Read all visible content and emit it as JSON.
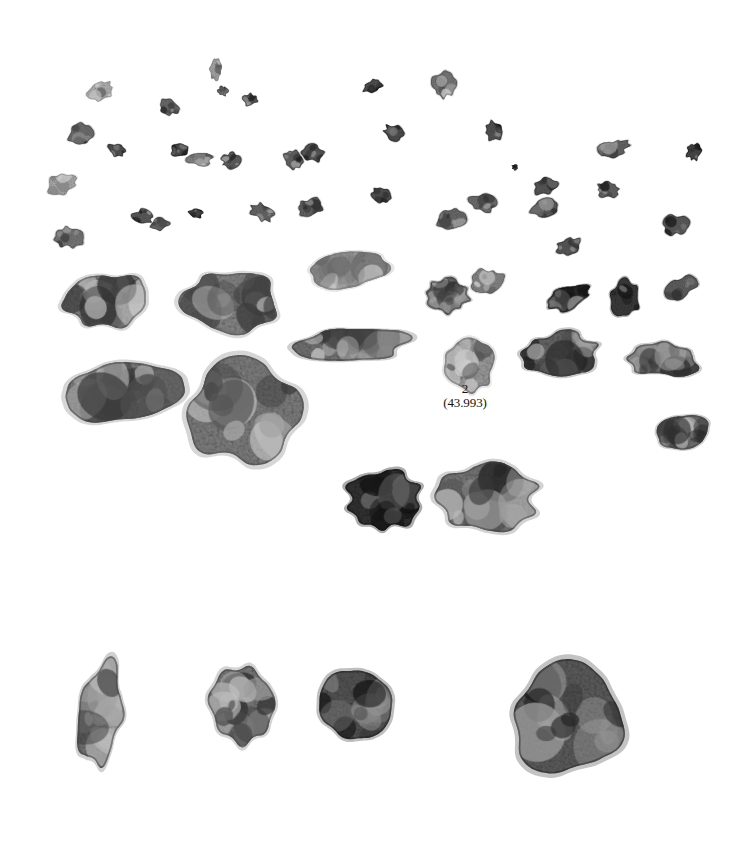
{
  "plate": {
    "width": 735,
    "height": 843,
    "background_color": "#ffffff",
    "description": "Black-and-white archival specimen photograph of rock fragments on a plain white background",
    "ink_color": "#15130f"
  },
  "labels": [
    {
      "name": "sample-label-2",
      "number": "2",
      "mass": "(43.993)",
      "x": 465,
      "y": 391
    }
  ],
  "groups": [
    {
      "name": "fines-and-fragments-cluster",
      "description": "Upper dense field of small to medium angular fragments"
    },
    {
      "name": "large-chips-row",
      "description": "Lower row of four larger chips"
    }
  ],
  "fragments": [
    {
      "id": "f001",
      "cx": 101,
      "cy": 91,
      "rx": 13,
      "ry": 9,
      "rot": -18,
      "tone": 0.86,
      "seed": 11,
      "rough": 0.4
    },
    {
      "id": "f002",
      "cx": 216,
      "cy": 70,
      "rx": 6,
      "ry": 10,
      "rot": 8,
      "tone": 0.8,
      "seed": 12,
      "rough": 0.42
    },
    {
      "id": "f003",
      "cx": 223,
      "cy": 91,
      "rx": 5,
      "ry": 5,
      "rot": 0,
      "tone": 0.52,
      "seed": 13,
      "rough": 0.45
    },
    {
      "id": "f004",
      "cx": 169,
      "cy": 107,
      "rx": 10,
      "ry": 7,
      "rot": 22,
      "tone": 0.48,
      "seed": 14,
      "rough": 0.42
    },
    {
      "id": "f005",
      "cx": 250,
      "cy": 100,
      "rx": 7,
      "ry": 6,
      "rot": -10,
      "tone": 0.4,
      "seed": 15,
      "rough": 0.44
    },
    {
      "id": "f006",
      "cx": 313,
      "cy": 153,
      "rx": 11,
      "ry": 8,
      "rot": 14,
      "tone": 0.38,
      "seed": 16,
      "rough": 0.42
    },
    {
      "id": "f007",
      "cx": 373,
      "cy": 86,
      "rx": 10,
      "ry": 6,
      "rot": -24,
      "tone": 0.34,
      "seed": 17,
      "rough": 0.4
    },
    {
      "id": "f008",
      "cx": 444,
      "cy": 84,
      "rx": 11,
      "ry": 13,
      "rot": 10,
      "tone": 0.55,
      "seed": 18,
      "rough": 0.44
    },
    {
      "id": "f009",
      "cx": 81,
      "cy": 135,
      "rx": 12,
      "ry": 10,
      "rot": -30,
      "tone": 0.5,
      "seed": 19,
      "rough": 0.44
    },
    {
      "id": "f010",
      "cx": 117,
      "cy": 150,
      "rx": 9,
      "ry": 6,
      "rot": 12,
      "tone": 0.34,
      "seed": 20,
      "rough": 0.4
    },
    {
      "id": "f011",
      "cx": 180,
      "cy": 150,
      "rx": 9,
      "ry": 6,
      "rot": -6,
      "tone": 0.3,
      "seed": 21,
      "rough": 0.42
    },
    {
      "id": "f012",
      "cx": 199,
      "cy": 159,
      "rx": 13,
      "ry": 7,
      "rot": 8,
      "tone": 0.62,
      "seed": 22,
      "rough": 0.46
    },
    {
      "id": "f013",
      "cx": 231,
      "cy": 161,
      "rx": 9,
      "ry": 8,
      "rot": 0,
      "tone": 0.42,
      "seed": 23,
      "rough": 0.44
    },
    {
      "id": "f014",
      "cx": 293,
      "cy": 160,
      "rx": 9,
      "ry": 10,
      "rot": -12,
      "tone": 0.44,
      "seed": 24,
      "rough": 0.45
    },
    {
      "id": "f015",
      "cx": 394,
      "cy": 133,
      "rx": 10,
      "ry": 8,
      "rot": 20,
      "tone": 0.32,
      "seed": 25,
      "rough": 0.43
    },
    {
      "id": "f016",
      "cx": 494,
      "cy": 131,
      "rx": 9,
      "ry": 10,
      "rot": -14,
      "tone": 0.36,
      "seed": 26,
      "rough": 0.44
    },
    {
      "id": "f017",
      "cx": 515,
      "cy": 167,
      "rx": 3,
      "ry": 3,
      "rot": 0,
      "tone": 0.22,
      "seed": 27,
      "rough": 0.5
    },
    {
      "id": "f018",
      "cx": 545,
      "cy": 186,
      "rx": 12,
      "ry": 8,
      "rot": -16,
      "tone": 0.38,
      "seed": 28,
      "rough": 0.44
    },
    {
      "id": "f019",
      "cx": 612,
      "cy": 149,
      "rx": 16,
      "ry": 8,
      "rot": -20,
      "tone": 0.46,
      "seed": 29,
      "rough": 0.46
    },
    {
      "id": "f020",
      "cx": 694,
      "cy": 152,
      "rx": 7,
      "ry": 8,
      "rot": 10,
      "tone": 0.3,
      "seed": 30,
      "rough": 0.44
    },
    {
      "id": "f021",
      "cx": 62,
      "cy": 184,
      "rx": 15,
      "ry": 10,
      "rot": -8,
      "tone": 0.82,
      "seed": 31,
      "rough": 0.44
    },
    {
      "id": "f022",
      "cx": 143,
      "cy": 217,
      "rx": 10,
      "ry": 7,
      "rot": 16,
      "tone": 0.4,
      "seed": 32,
      "rough": 0.44
    },
    {
      "id": "f023",
      "cx": 160,
      "cy": 224,
      "rx": 9,
      "ry": 6,
      "rot": -10,
      "tone": 0.48,
      "seed": 33,
      "rough": 0.42
    },
    {
      "id": "f024",
      "cx": 196,
      "cy": 213,
      "rx": 7,
      "ry": 5,
      "rot": 0,
      "tone": 0.28,
      "seed": 34,
      "rough": 0.42
    },
    {
      "id": "f025",
      "cx": 262,
      "cy": 212,
      "rx": 12,
      "ry": 8,
      "rot": 24,
      "tone": 0.46,
      "seed": 35,
      "rough": 0.45
    },
    {
      "id": "f026",
      "cx": 310,
      "cy": 207,
      "rx": 13,
      "ry": 8,
      "rot": -12,
      "tone": 0.44,
      "seed": 36,
      "rough": 0.45
    },
    {
      "id": "f027",
      "cx": 381,
      "cy": 195,
      "rx": 9,
      "ry": 7,
      "rot": 18,
      "tone": 0.34,
      "seed": 37,
      "rough": 0.42
    },
    {
      "id": "f028",
      "cx": 451,
      "cy": 219,
      "rx": 14,
      "ry": 10,
      "rot": -8,
      "tone": 0.48,
      "seed": 38,
      "rough": 0.46
    },
    {
      "id": "f029",
      "cx": 483,
      "cy": 203,
      "rx": 13,
      "ry": 9,
      "rot": 14,
      "tone": 0.5,
      "seed": 39,
      "rough": 0.45
    },
    {
      "id": "f030",
      "cx": 545,
      "cy": 208,
      "rx": 14,
      "ry": 9,
      "rot": -18,
      "tone": 0.4,
      "seed": 40,
      "rough": 0.46
    },
    {
      "id": "f031",
      "cx": 608,
      "cy": 190,
      "rx": 11,
      "ry": 8,
      "rot": 8,
      "tone": 0.44,
      "seed": 41,
      "rough": 0.44
    },
    {
      "id": "f032",
      "cx": 676,
      "cy": 225,
      "rx": 12,
      "ry": 10,
      "rot": -14,
      "tone": 0.4,
      "seed": 42,
      "rough": 0.46
    },
    {
      "id": "f033",
      "cx": 68,
      "cy": 237,
      "rx": 14,
      "ry": 10,
      "rot": 12,
      "tone": 0.54,
      "seed": 43,
      "rough": 0.46
    },
    {
      "id": "f034",
      "cx": 569,
      "cy": 246,
      "rx": 12,
      "ry": 8,
      "rot": -22,
      "tone": 0.38,
      "seed": 44,
      "rough": 0.45
    },
    {
      "id": "f035",
      "cx": 106,
      "cy": 300,
      "rx": 42,
      "ry": 27,
      "rot": -4,
      "tone": 0.6,
      "seed": 45,
      "rough": 0.34
    },
    {
      "id": "f036",
      "cx": 232,
      "cy": 300,
      "rx": 48,
      "ry": 30,
      "rot": 6,
      "tone": 0.62,
      "seed": 46,
      "rough": 0.34
    },
    {
      "id": "f037",
      "cx": 348,
      "cy": 270,
      "rx": 37,
      "ry": 19,
      "rot": -5,
      "tone": 0.8,
      "seed": 47,
      "rough": 0.36
    },
    {
      "id": "f038",
      "cx": 447,
      "cy": 296,
      "rx": 22,
      "ry": 17,
      "rot": 10,
      "tone": 0.48,
      "seed": 48,
      "rough": 0.4
    },
    {
      "id": "f039",
      "cx": 488,
      "cy": 282,
      "rx": 16,
      "ry": 13,
      "rot": -8,
      "tone": 0.62,
      "seed": 49,
      "rough": 0.42
    },
    {
      "id": "f040",
      "cx": 568,
      "cy": 298,
      "rx": 22,
      "ry": 11,
      "rot": -18,
      "tone": 0.3,
      "seed": 50,
      "rough": 0.4
    },
    {
      "id": "f041",
      "cx": 626,
      "cy": 299,
      "rx": 14,
      "ry": 18,
      "rot": 6,
      "tone": 0.22,
      "seed": 51,
      "rough": 0.42
    },
    {
      "id": "f042",
      "cx": 680,
      "cy": 288,
      "rx": 16,
      "ry": 10,
      "rot": -22,
      "tone": 0.42,
      "seed": 52,
      "rough": 0.42
    },
    {
      "id": "f043",
      "cx": 351,
      "cy": 344,
      "rx": 57,
      "ry": 17,
      "rot": -4,
      "tone": 0.52,
      "seed": 53,
      "rough": 0.34
    },
    {
      "id": "f044",
      "cx": 469,
      "cy": 364,
      "rx": 24,
      "ry": 26,
      "rot": 3,
      "tone": 0.74,
      "seed": 54,
      "rough": 0.36
    },
    {
      "id": "f045",
      "cx": 558,
      "cy": 355,
      "rx": 38,
      "ry": 22,
      "rot": -3,
      "tone": 0.46,
      "seed": 55,
      "rough": 0.36
    },
    {
      "id": "f046",
      "cx": 665,
      "cy": 360,
      "rx": 34,
      "ry": 17,
      "rot": 2,
      "tone": 0.5,
      "seed": 56,
      "rough": 0.36
    },
    {
      "id": "f047",
      "cx": 121,
      "cy": 391,
      "rx": 56,
      "ry": 28,
      "rot": -6,
      "tone": 0.58,
      "seed": 57,
      "rough": 0.33
    },
    {
      "id": "f048",
      "cx": 243,
      "cy": 412,
      "rx": 56,
      "ry": 50,
      "rot": 4,
      "tone": 0.58,
      "seed": 58,
      "rough": 0.32
    },
    {
      "id": "f049",
      "cx": 682,
      "cy": 432,
      "rx": 26,
      "ry": 16,
      "rot": -6,
      "tone": 0.52,
      "seed": 59,
      "rough": 0.38
    },
    {
      "id": "f050",
      "cx": 383,
      "cy": 500,
      "rx": 36,
      "ry": 30,
      "rot": -5,
      "tone": 0.18,
      "seed": 60,
      "rough": 0.34
    },
    {
      "id": "f051",
      "cx": 487,
      "cy": 496,
      "rx": 48,
      "ry": 33,
      "rot": 4,
      "tone": 0.54,
      "seed": 61,
      "rough": 0.33
    },
    {
      "id": "f052",
      "cx": 100,
      "cy": 714,
      "rx": 22,
      "ry": 50,
      "rot": 8,
      "tone": 0.52,
      "seed": 62,
      "rough": 0.3
    },
    {
      "id": "f053",
      "cx": 243,
      "cy": 706,
      "rx": 31,
      "ry": 39,
      "rot": -4,
      "tone": 0.55,
      "seed": 63,
      "rough": 0.31
    },
    {
      "id": "f054",
      "cx": 355,
      "cy": 706,
      "rx": 37,
      "ry": 37,
      "rot": 5,
      "tone": 0.36,
      "seed": 64,
      "rough": 0.31
    },
    {
      "id": "f055",
      "cx": 568,
      "cy": 719,
      "rx": 57,
      "ry": 53,
      "rot": -3,
      "tone": 0.4,
      "seed": 65,
      "rough": 0.29
    }
  ]
}
